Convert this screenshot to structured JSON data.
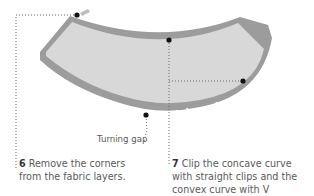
{
  "figure": {
    "colors": {
      "fabric_fill": "#d6d6d6",
      "seam_allowance": "#9a9a9a",
      "outline": "#7e7e7e",
      "dot": "#111111",
      "leader": "#666666"
    },
    "labels": {
      "turning_gap": "Turning gap"
    }
  },
  "steps": [
    {
      "number": "6",
      "text": "Remove the corners from the fabric layers."
    },
    {
      "number": "7",
      "text": "Clip the concave curve with straight clips and the convex curve with V notches."
    }
  ]
}
